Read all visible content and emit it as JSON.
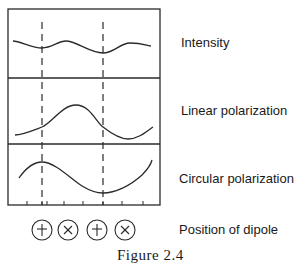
{
  "figure": {
    "caption": "Figure 2.4",
    "frame": {
      "x": 8,
      "y": 9,
      "width": 152,
      "height": 196
    },
    "panel_dividers_y": [
      78,
      144
    ],
    "dashed_lines_x": [
      42,
      103
    ],
    "tick_marks_x": [
      27,
      42,
      47,
      64,
      83,
      103,
      122,
      143
    ],
    "line_color": "#2a2a2a",
    "panels": [
      {
        "label": "Intensity",
        "curve": "M 13 41 C 20 41, 32 48, 42 48 C 52 48, 58 41, 66 41 C 76 41, 90 53, 103 53 C 114 53, 120 43, 130 43 C 140 43, 146 45, 151 46"
      },
      {
        "label": "Linear polarization",
        "curve": "M 15 135 C 22 135, 34 130, 42 127 C 52 123, 62 105, 76 105 C 90 105, 96 122, 103 127 C 112 134, 120 139, 128 139 C 138 139, 146 132, 153 127"
      },
      {
        "label": "Circular polarization",
        "curve": "M 19 178 C 26 168, 34 162, 42 162 C 55 162, 72 180, 82 186 C 92 192, 98 193, 103 193 C 115 193, 130 186, 142 175 C 148 169, 151 164, 152 160"
      }
    ],
    "dipole_row": {
      "label": "Position of dipole",
      "symbols": [
        {
          "type": "plus",
          "cx": 42,
          "cy": 230
        },
        {
          "type": "cross",
          "cx": 68,
          "cy": 230
        },
        {
          "type": "plus",
          "cx": 97,
          "cy": 230
        },
        {
          "type": "cross",
          "cx": 125,
          "cy": 230
        }
      ],
      "radius": 10
    }
  }
}
